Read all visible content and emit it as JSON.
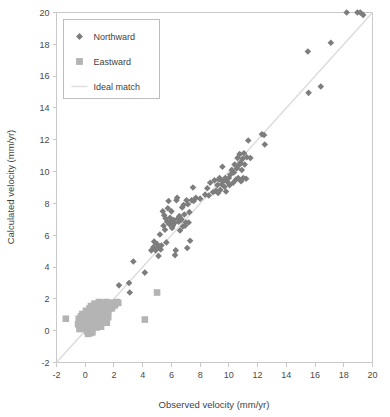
{
  "chart_data": {
    "type": "scatter",
    "title": "",
    "xlabel": "Observed velocity (mm/yr)",
    "ylabel": "Calculated velocity (mm/yr)",
    "xlim": [
      -2,
      20
    ],
    "ylim": [
      -2,
      20
    ],
    "xticks": [
      -2,
      0,
      2,
      4,
      6,
      8,
      10,
      12,
      14,
      16,
      18,
      20
    ],
    "yticks": [
      -2,
      0,
      2,
      4,
      6,
      8,
      10,
      12,
      14,
      16,
      18,
      20
    ],
    "xtick_labels": [
      "-2",
      "0",
      "2",
      "4",
      "6",
      "8",
      "10",
      "12",
      "14",
      "16",
      "18",
      "20"
    ],
    "ytick_labels": [
      "-2",
      "0",
      "2",
      "4",
      "6",
      "8",
      "10",
      "12",
      "14",
      "16",
      "18",
      "20"
    ],
    "grid": false,
    "legend_position": "upper-left",
    "colors": {
      "northward": "#7d7d7d",
      "eastward": "#b4b4b4",
      "ideal_match": "#dcdcdc",
      "frame": "#c9c9c9",
      "text": "#4a4a4a"
    },
    "series": [
      {
        "name": "Northward",
        "marker": "diamond",
        "color": "#7d7d7d",
        "size": 4.2,
        "points": [
          [
            2.35,
            2.85
          ],
          [
            3.05,
            3.0
          ],
          [
            3.1,
            2.4
          ],
          [
            3.35,
            4.35
          ],
          [
            4.15,
            3.65
          ],
          [
            4.6,
            5.05
          ],
          [
            4.75,
            5.25
          ],
          [
            4.8,
            5.6
          ],
          [
            4.9,
            5.05
          ],
          [
            5.0,
            5.45
          ],
          [
            5.05,
            5.25
          ],
          [
            5.1,
            4.7
          ],
          [
            5.2,
            6.05
          ],
          [
            5.25,
            5.1
          ],
          [
            5.3,
            5.35
          ],
          [
            5.4,
            7.5
          ],
          [
            5.45,
            6.6
          ],
          [
            5.5,
            7.25
          ],
          [
            5.55,
            6.35
          ],
          [
            5.6,
            7.05
          ],
          [
            5.65,
            5.55
          ],
          [
            5.7,
            6.85
          ],
          [
            5.75,
            7.7
          ],
          [
            5.8,
            8.15
          ],
          [
            5.85,
            6.7
          ],
          [
            5.9,
            7.1
          ],
          [
            5.95,
            6.9
          ],
          [
            6.0,
            7.5
          ],
          [
            6.05,
            6.45
          ],
          [
            6.1,
            6.6
          ],
          [
            6.15,
            6.95
          ],
          [
            6.2,
            6.75
          ],
          [
            6.25,
            4.75
          ],
          [
            6.3,
            5.05
          ],
          [
            6.35,
            8.2
          ],
          [
            6.4,
            8.35
          ],
          [
            6.45,
            7.05
          ],
          [
            6.5,
            6.85
          ],
          [
            6.55,
            7.2
          ],
          [
            6.6,
            6.3
          ],
          [
            6.65,
            6.95
          ],
          [
            6.7,
            7.0
          ],
          [
            6.75,
            7.75
          ],
          [
            6.8,
            6.55
          ],
          [
            6.85,
            7.9
          ],
          [
            6.9,
            7.3
          ],
          [
            6.95,
            6.6
          ],
          [
            7.0,
            6.8
          ],
          [
            7.05,
            8.2
          ],
          [
            7.1,
            5.2
          ],
          [
            7.15,
            7.95
          ],
          [
            7.2,
            6.8
          ],
          [
            7.25,
            7.45
          ],
          [
            7.3,
            5.65
          ],
          [
            7.4,
            8.2
          ],
          [
            7.5,
            9.0
          ],
          [
            7.55,
            8.15
          ],
          [
            7.7,
            8.35
          ],
          [
            8.0,
            8.3
          ],
          [
            8.35,
            8.55
          ],
          [
            8.5,
            8.95
          ],
          [
            8.6,
            8.5
          ],
          [
            8.7,
            9.3
          ],
          [
            8.9,
            8.7
          ],
          [
            9.0,
            9.45
          ],
          [
            9.1,
            8.8
          ],
          [
            9.2,
            9.15
          ],
          [
            9.25,
            8.65
          ],
          [
            9.3,
            9.5
          ],
          [
            9.35,
            9.6
          ],
          [
            9.4,
            8.85
          ],
          [
            9.5,
            9.2
          ],
          [
            9.55,
            10.3
          ],
          [
            9.6,
            9.4
          ],
          [
            9.7,
            9.05
          ],
          [
            9.75,
            9.6
          ],
          [
            9.8,
            8.75
          ],
          [
            9.9,
            9.35
          ],
          [
            10.0,
            9.6
          ],
          [
            10.05,
            9.15
          ],
          [
            10.1,
            9.8
          ],
          [
            10.2,
            10.1
          ],
          [
            10.3,
            9.3
          ],
          [
            10.35,
            9.95
          ],
          [
            10.4,
            10.45
          ],
          [
            10.5,
            9.5
          ],
          [
            10.55,
            10.2
          ],
          [
            10.6,
            10.85
          ],
          [
            10.65,
            9.6
          ],
          [
            10.7,
            10.4
          ],
          [
            10.75,
            11.1
          ],
          [
            10.8,
            10.55
          ],
          [
            10.85,
            9.4
          ],
          [
            10.9,
            10.1
          ],
          [
            10.95,
            10.8
          ],
          [
            11.0,
            9.6
          ],
          [
            11.05,
            11.15
          ],
          [
            11.1,
            10.45
          ],
          [
            11.2,
            9.55
          ],
          [
            11.25,
            10.9
          ],
          [
            11.35,
            11.95
          ],
          [
            11.5,
            10.85
          ],
          [
            12.3,
            12.35
          ],
          [
            12.45,
            12.3
          ],
          [
            12.5,
            11.7
          ],
          [
            15.5,
            17.55
          ],
          [
            15.55,
            14.95
          ],
          [
            16.4,
            15.35
          ],
          [
            17.1,
            18.1
          ],
          [
            18.2,
            20.0
          ],
          [
            18.95,
            20.0
          ],
          [
            19.15,
            20.0
          ],
          [
            19.35,
            19.85
          ]
        ]
      },
      {
        "name": "Eastward",
        "marker": "square",
        "color": "#b4b4b4",
        "size": 4.6,
        "points": [
          [
            -1.35,
            0.75
          ],
          [
            -0.5,
            0.4
          ],
          [
            -0.45,
            0.75
          ],
          [
            -0.4,
            0.1
          ],
          [
            -0.35,
            0.55
          ],
          [
            -0.3,
            0.9
          ],
          [
            -0.25,
            0.25
          ],
          [
            -0.2,
            0.6
          ],
          [
            -0.2,
            1.05
          ],
          [
            -0.15,
            0.4
          ],
          [
            -0.1,
            0.8
          ],
          [
            -0.1,
            0.15
          ],
          [
            -0.05,
            0.55
          ],
          [
            0.0,
            0.95
          ],
          [
            0.0,
            0.3
          ],
          [
            0.05,
            0.7
          ],
          [
            0.05,
            1.25
          ],
          [
            0.1,
            0.45
          ],
          [
            0.1,
            0.05
          ],
          [
            0.15,
            0.85
          ],
          [
            0.2,
            1.15
          ],
          [
            0.2,
            0.5
          ],
          [
            0.25,
            0.2
          ],
          [
            0.25,
            0.95
          ],
          [
            0.3,
            1.4
          ],
          [
            0.3,
            0.6
          ],
          [
            0.35,
            1.1
          ],
          [
            0.35,
            0.3
          ],
          [
            0.4,
            0.8
          ],
          [
            0.4,
            1.55
          ],
          [
            0.45,
            1.25
          ],
          [
            0.45,
            0.45
          ],
          [
            0.5,
            0.95
          ],
          [
            0.5,
            0.15
          ],
          [
            0.55,
            1.45
          ],
          [
            0.55,
            0.65
          ],
          [
            0.6,
            1.1
          ],
          [
            0.6,
            0.35
          ],
          [
            0.65,
            1.7
          ],
          [
            0.65,
            0.85
          ],
          [
            0.7,
            1.3
          ],
          [
            0.7,
            0.5
          ],
          [
            0.75,
            1.55
          ],
          [
            0.75,
            0.95
          ],
          [
            0.8,
            0.2
          ],
          [
            0.8,
            1.15
          ],
          [
            0.85,
            1.65
          ],
          [
            0.85,
            0.6
          ],
          [
            0.9,
            1.35
          ],
          [
            0.9,
            0.9
          ],
          [
            0.95,
            1.8
          ],
          [
            0.95,
            0.35
          ],
          [
            1.0,
            1.2
          ],
          [
            1.0,
            1.55
          ],
          [
            1.05,
            0.7
          ],
          [
            1.05,
            1.0
          ],
          [
            1.1,
            1.45
          ],
          [
            1.1,
            0.25
          ],
          [
            1.15,
            1.7
          ],
          [
            1.15,
            0.85
          ],
          [
            1.2,
            1.25
          ],
          [
            1.2,
            1.55
          ],
          [
            1.25,
            0.55
          ],
          [
            1.25,
            1.05
          ],
          [
            1.3,
            1.4
          ],
          [
            1.3,
            1.75
          ],
          [
            1.35,
            0.75
          ],
          [
            1.35,
            1.2
          ],
          [
            1.4,
            1.6
          ],
          [
            1.4,
            0.95
          ],
          [
            1.45,
            1.35
          ],
          [
            1.45,
            1.8
          ],
          [
            1.5,
            1.1
          ],
          [
            1.5,
            0.5
          ],
          [
            1.55,
            1.5
          ],
          [
            1.55,
            1.75
          ],
          [
            1.6,
            1.2
          ],
          [
            1.6,
            0.85
          ],
          [
            1.65,
            1.6
          ],
          [
            1.65,
            1.35
          ],
          [
            1.7,
            1.75
          ],
          [
            1.75,
            1.5
          ],
          [
            1.8,
            1.65
          ],
          [
            1.85,
            1.4
          ],
          [
            1.9,
            1.7
          ],
          [
            1.95,
            1.55
          ],
          [
            2.0,
            1.75
          ],
          [
            2.05,
            1.6
          ],
          [
            2.1,
            1.7
          ],
          [
            2.2,
            1.8
          ],
          [
            2.3,
            1.75
          ],
          [
            0.2,
            -0.2
          ],
          [
            0.35,
            -0.15
          ],
          [
            0.5,
            -0.1
          ],
          [
            0.15,
            -0.05
          ],
          [
            4.15,
            0.7
          ],
          [
            5.0,
            2.4
          ]
        ]
      }
    ],
    "reference_line": {
      "name": "Ideal match",
      "type": "line",
      "color": "#dcdcdc",
      "from": [
        -2,
        -2
      ],
      "to": [
        20,
        20
      ]
    },
    "legend": [
      {
        "label": "Northward",
        "marker": "diamond",
        "color": "#7d7d7d"
      },
      {
        "label": "Eastward",
        "marker": "square",
        "color": "#b4b4b4"
      },
      {
        "label": "Ideal match",
        "marker": "line",
        "color": "#dcdcdc"
      }
    ]
  }
}
